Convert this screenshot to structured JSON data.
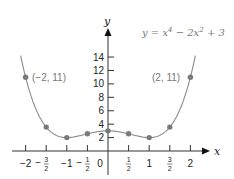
{
  "chart_data": {
    "type": "line",
    "title": "",
    "equation": "y = x^4 - 2x^2 + 3",
    "equation_display": {
      "base": "y = x",
      "exp1": "4",
      "mid": " − 2x",
      "exp2": "2",
      "tail": " + 3"
    },
    "xlabel": "x",
    "ylabel": "y",
    "xlim": [
      -2,
      2
    ],
    "ylim": [
      0,
      14
    ],
    "x_ticks": [
      {
        "value": -2,
        "label": "−2"
      },
      {
        "value": -1.5,
        "label": "−",
        "num": "3",
        "den": "2"
      },
      {
        "value": -1,
        "label": "−1"
      },
      {
        "value": -0.5,
        "label": "−",
        "num": "1",
        "den": "2"
      },
      {
        "value": 0,
        "label": "0"
      },
      {
        "value": 0.5,
        "label": "",
        "num": "1",
        "den": "2"
      },
      {
        "value": 1,
        "label": "1"
      },
      {
        "value": 1.5,
        "label": "",
        "num": "3",
        "den": "2"
      },
      {
        "value": 2,
        "label": "2"
      }
    ],
    "y_ticks": [
      2,
      4,
      6,
      8,
      10,
      12,
      14
    ],
    "points": [
      {
        "x": -2,
        "y": 11
      },
      {
        "x": -1.5,
        "y": 3.5625
      },
      {
        "x": -1,
        "y": 2
      },
      {
        "x": -0.5,
        "y": 2.5625
      },
      {
        "x": 0,
        "y": 3
      },
      {
        "x": 0.5,
        "y": 2.5625
      },
      {
        "x": 1,
        "y": 2
      },
      {
        "x": 1.5,
        "y": 3.5625
      },
      {
        "x": 2,
        "y": 11
      }
    ],
    "annotations": [
      {
        "text": "(−2, 11)",
        "x": -2,
        "y": 11
      },
      {
        "text": "(2, 11)",
        "x": 2,
        "y": 11
      }
    ],
    "grid": false,
    "colors": {
      "curve": "#8a8a8a",
      "points": "#7a7a7a",
      "axes": "#333333",
      "annotation": "#777777"
    }
  }
}
